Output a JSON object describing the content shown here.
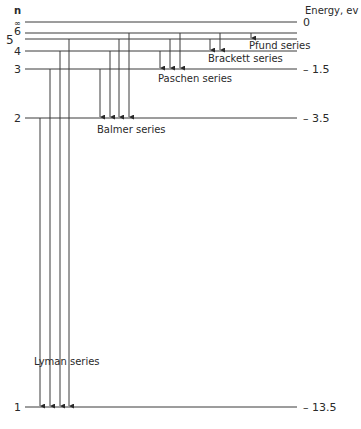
{
  "axis": {
    "n_header": "n",
    "energy_header": "Energy, ev"
  },
  "levels": [
    {
      "n": "∞",
      "y": 22,
      "energy": "0",
      "small": true
    },
    {
      "n": "6",
      "y": 33,
      "energy": ""
    },
    {
      "n": "5",
      "y": 39,
      "energy": ""
    },
    {
      "n": "4",
      "y": 51,
      "energy": ""
    },
    {
      "n": "3",
      "y": 69,
      "energy": "– 1.5"
    },
    {
      "n": "2",
      "y": 118,
      "energy": "– 3.5"
    },
    {
      "n": "1",
      "y": 407,
      "energy": "– 13.5"
    }
  ],
  "series": [
    {
      "name": "Lyman series",
      "label_x": 34,
      "label_y": 365,
      "transitions": [
        {
          "x": 40,
          "from": 118,
          "to": 407
        },
        {
          "x": 50,
          "from": 69,
          "to": 407
        },
        {
          "x": 60,
          "from": 51,
          "to": 407
        },
        {
          "x": 69,
          "from": 39,
          "to": 407
        }
      ]
    },
    {
      "name": "Balmer series",
      "label_x": 97,
      "label_y": 133,
      "transitions": [
        {
          "x": 100,
          "from": 69,
          "to": 118
        },
        {
          "x": 110,
          "from": 51,
          "to": 118
        },
        {
          "x": 119,
          "from": 39,
          "to": 118
        },
        {
          "x": 129,
          "from": 33,
          "to": 118
        }
      ]
    },
    {
      "name": "Paschen series",
      "label_x": 158,
      "label_y": 82,
      "transitions": [
        {
          "x": 160,
          "from": 51,
          "to": 69
        },
        {
          "x": 170,
          "from": 39,
          "to": 69
        },
        {
          "x": 180,
          "from": 33,
          "to": 69
        }
      ]
    },
    {
      "name": "Brackett series",
      "label_x": 208,
      "label_y": 62,
      "transitions": [
        {
          "x": 210,
          "from": 39,
          "to": 51
        },
        {
          "x": 220,
          "from": 33,
          "to": 51
        }
      ]
    },
    {
      "name": "Pfund series",
      "label_x": 249,
      "label_y": 49,
      "transitions": [
        {
          "x": 251,
          "from": 33,
          "to": 39
        }
      ]
    }
  ],
  "colors": {
    "line": "#3a3a3a",
    "text": "#2a2a2a"
  }
}
